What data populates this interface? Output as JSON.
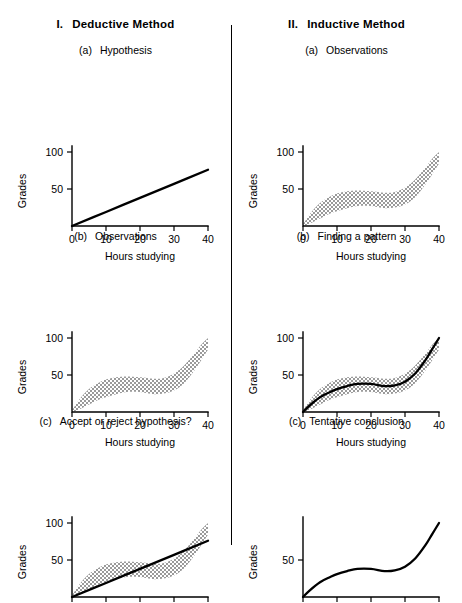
{
  "figure": {
    "axis": {
      "xlabel": "Hours studying",
      "ylabel": "Grades",
      "xticks": [
        "0",
        "10",
        "20",
        "30",
        "40"
      ],
      "yticks_full": [
        "50",
        "100"
      ],
      "yticks_partial": [
        "50"
      ],
      "xlim": [
        0,
        40
      ],
      "ylim": [
        0,
        100
      ]
    },
    "columns": [
      {
        "numeral": "I.",
        "title": "Deductive Method",
        "panels": [
          {
            "tag": "(a)",
            "title": "Hypothesis",
            "show_band": false,
            "show_line": true,
            "show_curve": false,
            "ytop_label": true
          },
          {
            "tag": "(b)",
            "title": "Observations",
            "show_band": true,
            "show_line": false,
            "show_curve": false,
            "ytop_label": true
          },
          {
            "tag": "(c)",
            "title": "Accept or reject hypothesis?",
            "show_band": true,
            "show_line": true,
            "show_curve": false,
            "ytop_label": true
          }
        ]
      },
      {
        "numeral": "II.",
        "title": "Inductive Method",
        "panels": [
          {
            "tag": "(a)",
            "title": "Observations",
            "show_band": true,
            "show_line": false,
            "show_curve": false,
            "ytop_label": true
          },
          {
            "tag": "(b)",
            "title": "Finding a pattern",
            "show_band": true,
            "show_line": false,
            "show_curve": true,
            "ytop_label": true
          },
          {
            "tag": "(c)",
            "title": "Tentative conclusion",
            "show_band": false,
            "show_line": false,
            "show_curve": true,
            "ytop_label": false
          }
        ]
      }
    ]
  },
  "chart_data": {
    "type": "line",
    "xlabel": "Hours studying",
    "ylabel": "Grades",
    "xlim": [
      0,
      40
    ],
    "ylim": [
      0,
      100
    ],
    "xticks": [
      0,
      10,
      20,
      30,
      40
    ],
    "yticks": [
      0,
      50,
      100
    ],
    "grid": false,
    "legend": "none",
    "series": [
      {
        "name": "hypothesis-line",
        "type": "line",
        "description": "Straight linear hypothesis: grades increase proportionally with hours studying",
        "x": [
          0,
          10,
          20,
          30,
          40
        ],
        "values": [
          0,
          19,
          38,
          57,
          76
        ]
      },
      {
        "name": "observed-pattern-curve",
        "type": "line",
        "description": "S-shaped cubic pattern fitted to the observed data cloud",
        "x": [
          0,
          2,
          5,
          8,
          10,
          13,
          16,
          20,
          24,
          27,
          30,
          33,
          36,
          38,
          40
        ],
        "values": [
          0,
          9,
          20,
          27,
          31,
          35,
          38,
          38,
          35,
          36,
          41,
          52,
          70,
          85,
          100
        ]
      },
      {
        "name": "observations-band-upper",
        "type": "area",
        "description": "Upper edge of stippled scatter band of observations",
        "x": [
          0,
          2,
          5,
          8,
          10,
          13,
          16,
          20,
          24,
          27,
          30,
          33,
          36,
          38,
          40
        ],
        "values": [
          2,
          16,
          31,
          40,
          44,
          47,
          48,
          47,
          45,
          46,
          52,
          63,
          79,
          91,
          100
        ]
      },
      {
        "name": "observations-band-lower",
        "type": "area",
        "description": "Lower edge of stippled scatter band of observations",
        "x": [
          0,
          2,
          5,
          8,
          10,
          13,
          16,
          20,
          24,
          27,
          30,
          33,
          36,
          38,
          40
        ],
        "values": [
          0,
          3,
          10,
          17,
          20,
          24,
          27,
          27,
          24,
          25,
          29,
          39,
          56,
          70,
          84
        ]
      }
    ]
  }
}
